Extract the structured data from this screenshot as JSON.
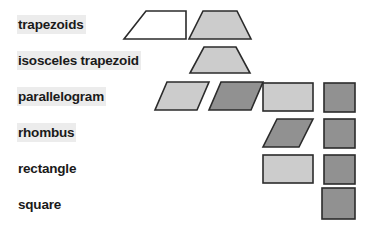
{
  "diagram": {
    "background_color": "#ffffff",
    "highlight_color": "#ececec",
    "label_color": "#1a1a1a",
    "outline_color": "#2b2b2b",
    "fill_light": "#cccccc",
    "fill_dark": "#919191",
    "fill_white": "#ffffff",
    "rows": [
      {
        "id": "trapezoids",
        "label": "trapezoids",
        "highlighted": true,
        "label_top": 15,
        "shapes": [
          {
            "name": "right-trapezoid",
            "fill": "white",
            "column": 1
          },
          {
            "name": "isosceles-trapezoid",
            "fill": "light",
            "column": 2
          }
        ]
      },
      {
        "id": "isosceles-trapezoid",
        "label": "isosceles trapezoid",
        "highlighted": true,
        "label_top": 51,
        "shapes": [
          {
            "name": "isosceles-trapezoid",
            "fill": "light",
            "column": 2
          }
        ]
      },
      {
        "id": "parallelogram",
        "label": "parallelogram",
        "highlighted": true,
        "label_top": 87,
        "shapes": [
          {
            "name": "parallelogram",
            "fill": "light",
            "column": 1
          },
          {
            "name": "parallelogram",
            "fill": "dark",
            "column": 2
          },
          {
            "name": "rectangle",
            "fill": "light",
            "column": 3
          },
          {
            "name": "square",
            "fill": "dark",
            "column": 4
          }
        ]
      },
      {
        "id": "rhombus",
        "label": "rhombus",
        "highlighted": true,
        "label_top": 123,
        "shapes": [
          {
            "name": "rhombus",
            "fill": "dark",
            "column": 3
          },
          {
            "name": "square",
            "fill": "dark",
            "column": 4
          }
        ]
      },
      {
        "id": "rectangle",
        "label": "rectangle",
        "highlighted": false,
        "label_top": 159,
        "shapes": [
          {
            "name": "rectangle",
            "fill": "light",
            "column": 3
          },
          {
            "name": "square",
            "fill": "dark",
            "column": 4
          }
        ]
      },
      {
        "id": "square",
        "label": "square",
        "highlighted": false,
        "label_top": 195,
        "shapes": [
          {
            "name": "square",
            "fill": "dark",
            "column": 4
          }
        ]
      }
    ]
  }
}
